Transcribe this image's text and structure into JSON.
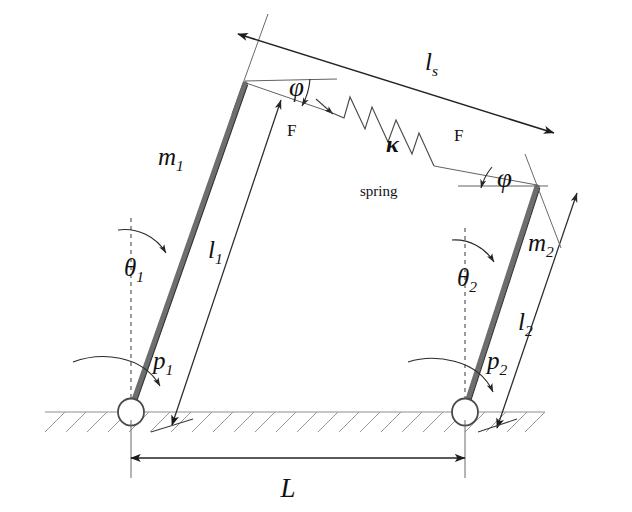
{
  "figure": {
    "type": "mechanics-free-body-diagram",
    "background_color": "#ffffff",
    "rod_color": "#6e6e6e",
    "ground_color": "#9a9a9a",
    "ink_color": "#111111"
  },
  "labels": {
    "mass_left": "m",
    "mass_left_sub": "1",
    "mass_right": "m",
    "mass_right_sub": "2",
    "length_left": "l",
    "length_left_sub": "1",
    "length_right": "l",
    "length_right_sub": "2",
    "spring_length": "l",
    "spring_length_sub": "s",
    "theta_left": "θ",
    "theta_left_sub": "1",
    "theta_right": "θ",
    "theta_right_sub": "2",
    "momentum_left": "p",
    "momentum_left_sub": "1",
    "momentum_right": "p",
    "momentum_right_sub": "2",
    "spring_constant": "κ",
    "spring_word": "spring",
    "force_left": "F",
    "force_right": "F",
    "phi_left": "φ",
    "phi_right": "φ",
    "separation": "L"
  },
  "geometry": {
    "ground_y": 412,
    "pivot_left": {
      "x": 131,
      "y": 412
    },
    "pivot_right": {
      "x": 465,
      "y": 412
    },
    "rod_left_top": {
      "x": 245,
      "y": 81
    },
    "rod_right_top": {
      "x": 537,
      "y": 184
    },
    "separation_px": 334,
    "hatch_count": 24,
    "spring_coils": 4
  },
  "annotations": {
    "angles_measured_from": "vertical dashed reference",
    "phi_measured_from": "horizontal reference at rod tip",
    "spring_tension_direction": "along spring axis"
  }
}
